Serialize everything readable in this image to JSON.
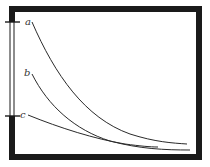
{
  "diagram": {
    "title": "",
    "frame_color": "#1a1a1a",
    "curve_color": "#2a2a2a",
    "curves": [
      {
        "id": "a",
        "label": "a"
      },
      {
        "id": "b",
        "label": "b"
      },
      {
        "id": "c",
        "label": "c"
      }
    ]
  }
}
